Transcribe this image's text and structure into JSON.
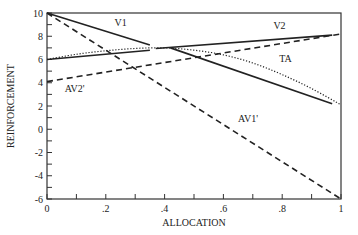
{
  "chart_data": {
    "type": "line",
    "title": "",
    "xlabel": "ALLOCATION",
    "ylabel": "REINFORCEMENT",
    "xlim": [
      0,
      1
    ],
    "ylim": [
      -6,
      10
    ],
    "grid": false,
    "legend": "none (inline series labels)",
    "x_ticks": [
      0,
      0.2,
      0.4,
      0.6,
      0.8,
      1
    ],
    "x_tick_labels": [
      "0",
      ".2",
      ".4",
      ".6",
      ".8",
      "1"
    ],
    "x_minor_step": 0.1,
    "y_ticks": [
      -6,
      -4,
      -2,
      0,
      2,
      4,
      6,
      8,
      10
    ],
    "y_tick_labels": [
      "-6",
      "-4",
      "-2",
      "0",
      "2",
      "4",
      "6",
      "8",
      "10"
    ],
    "y_minor_step": 1,
    "series": [
      {
        "name": "V1",
        "style": "solid",
        "segments": [
          {
            "x": [
              0,
              0.35
            ],
            "y": [
              10,
              7.25
            ]
          },
          {
            "x": [
              0.42,
              0.97
            ],
            "y": [
              7.0,
              2.2
            ]
          }
        ],
        "label": "V1",
        "label_at": {
          "x": 0.23,
          "y": 8.9
        }
      },
      {
        "name": "V2",
        "style": "solid",
        "segments": [
          {
            "x": [
              0,
              0.35
            ],
            "y": [
              6.0,
              6.8
            ]
          },
          {
            "x": [
              0.37,
              0.97
            ],
            "y": [
              6.95,
              8.1
            ]
          }
        ],
        "label": "V2",
        "label_at": {
          "x": 0.77,
          "y": 8.6
        }
      },
      {
        "name": "TA",
        "style": "dotted",
        "x": [
          0,
          0.1,
          0.2,
          0.3,
          0.4,
          0.5,
          0.6,
          0.7,
          0.8,
          0.9,
          1.0
        ],
        "y": [
          6.0,
          6.45,
          6.75,
          6.95,
          7.0,
          6.8,
          6.4,
          5.7,
          4.7,
          3.5,
          2.1
        ],
        "label": "TA",
        "label_at": {
          "x": 0.79,
          "y": 5.8
        }
      },
      {
        "name": "AV1'",
        "style": "dashed",
        "x": [
          0,
          1
        ],
        "y": [
          10,
          -6
        ],
        "label": "AV1'",
        "label_at": {
          "x": 0.65,
          "y": 0.6
        }
      },
      {
        "name": "AV2'",
        "style": "dashed",
        "x": [
          0,
          1
        ],
        "y": [
          4.1,
          8.2
        ],
        "label": "AV2'",
        "label_at": {
          "x": 0.06,
          "y": 3.2
        }
      }
    ]
  }
}
